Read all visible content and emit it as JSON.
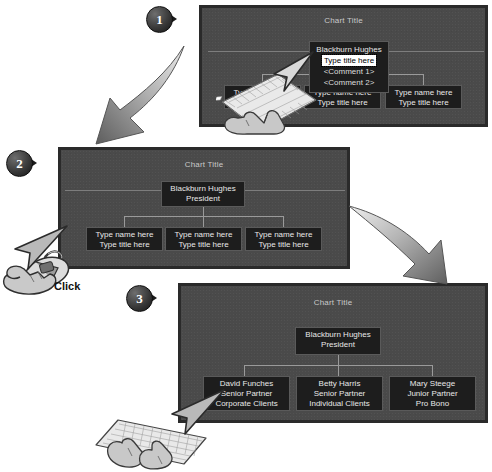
{
  "figure": {
    "caption_click": "Click"
  },
  "steps": [
    {
      "number": "1"
    },
    {
      "number": "2"
    },
    {
      "number": "3"
    }
  ],
  "panels": [
    {
      "id": "panel-1",
      "chart_title": "Chart Title",
      "root": {
        "name": "Blackburn Hughes",
        "title_selected": "Type title here",
        "comment1": "<Comment 1>",
        "comment2": "<Comment 2>"
      },
      "children": [
        {
          "name": "Type name here",
          "title": "Type title here"
        },
        {
          "name": "Type name here",
          "title": "Type title here"
        },
        {
          "name": "Type name here",
          "title": "Type title here"
        }
      ]
    },
    {
      "id": "panel-2",
      "chart_title": "Chart Title",
      "root": {
        "name": "Blackburn Hughes",
        "title": "President"
      },
      "children": [
        {
          "name": "Type name here",
          "title": "Type title here"
        },
        {
          "name": "Type name here",
          "title": "Type title here"
        },
        {
          "name": "Type name here",
          "title": "Type title here"
        }
      ]
    },
    {
      "id": "panel-3",
      "chart_title": "Chart Title",
      "root": {
        "name": "Blackburn Hughes",
        "title": "President"
      },
      "children": [
        {
          "name": "David Funches",
          "title": "Senior Partner",
          "detail": "Corporate Clients"
        },
        {
          "name": "Betty Harris",
          "title": "Senior Partner",
          "detail": "Individual Clients"
        },
        {
          "name": "Mary Steege",
          "title": "Junior Partner",
          "detail": "Pro Bono"
        }
      ]
    }
  ],
  "colors": {
    "panel_background": "#4a4a4a",
    "panel_border": "#2a2a2a",
    "node_background": "#1d1d1d",
    "node_text": "#e8e8e8",
    "selection_background": "#ffffff",
    "selection_text": "#000000",
    "connector": "#9a9a9a",
    "arrow_light": "#d8d8d8",
    "arrow_dark": "#6f6f6f",
    "badge_text": "#ffffff"
  }
}
